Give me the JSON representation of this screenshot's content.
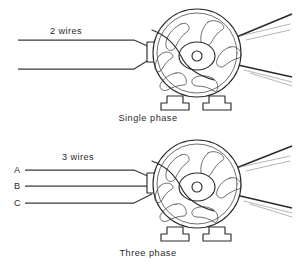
{
  "figure": {
    "background_color": "#ffffff",
    "line_color": "#2b2b2b",
    "text_color": "#2b2b2b"
  },
  "diagrams": [
    {
      "id": "single-phase",
      "caption": "Single phase",
      "wire_count_label": "2 wires",
      "wire_labels": [],
      "wire_count": 2,
      "motor": {
        "vent_count": 6,
        "foot_count": 2,
        "has_junction_box": true,
        "has_shaft_hub": true,
        "belt_line_count": 2
      }
    },
    {
      "id": "three-phase",
      "caption": "Three phase",
      "wire_count_label": "3 wires",
      "wire_labels": [
        "A",
        "B",
        "C"
      ],
      "wire_count": 3,
      "motor": {
        "vent_count": 6,
        "foot_count": 2,
        "has_junction_box": true,
        "has_shaft_hub": true,
        "belt_line_count": 2
      }
    }
  ],
  "icons": {
    "motor": "motor-icon",
    "junction_box": "junction-box-icon",
    "mounting_foot": "mounting-foot-icon",
    "vent_slot": "vent-slot-icon",
    "shaft_hub": "shaft-hub-icon",
    "belt": "belt-line-icon"
  }
}
